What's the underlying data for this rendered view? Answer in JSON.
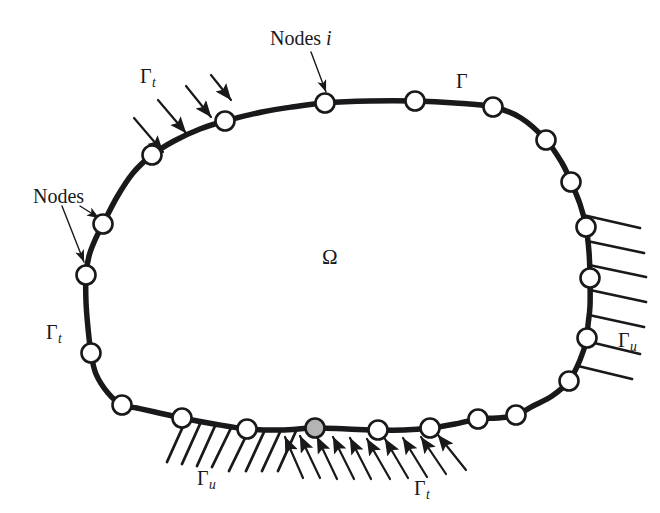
{
  "figure": {
    "kind": "boundary-node-discretization-diagram",
    "background_color": "#ffffff",
    "ink_color": "#19191c",
    "node_fill": "#ffffff",
    "node_highlight_fill": "#b4b4b4",
    "boundary_stroke_width": 5.5
  },
  "labels": {
    "nodes_i": {
      "text_plain": "Nodes i",
      "prefix": "Nodes ",
      "italic": "i"
    },
    "gamma": {
      "symbol": "Γ",
      "sub": ""
    },
    "gamma_t_top": {
      "symbol": "Γ",
      "sub": "t"
    },
    "nodes": {
      "text": "Nodes"
    },
    "omega": {
      "symbol": "Ω"
    },
    "gamma_t_left": {
      "symbol": "Γ",
      "sub": "t"
    },
    "gamma_u_right": {
      "symbol": "Γ",
      "sub": "u"
    },
    "gamma_u_bottom": {
      "symbol": "Γ",
      "sub": "u"
    },
    "gamma_t_bottom": {
      "symbol": "Γ",
      "sub": "t"
    }
  },
  "chart_data": {
    "type": "scatter",
    "title": "",
    "xlabel": "",
    "ylabel": "",
    "xlim": [
      0,
      660
    ],
    "ylim": [
      0,
      513
    ],
    "grid": false,
    "legend_position": "none",
    "domain_label": "Ω",
    "boundary_label": "Γ",
    "boundary_outline": [
      [
        225,
        121
      ],
      [
        262,
        112
      ],
      [
        292,
        107
      ],
      [
        325,
        103
      ],
      [
        370,
        101
      ],
      [
        415,
        101
      ],
      [
        455,
        103
      ],
      [
        493,
        107
      ],
      [
        521,
        118
      ],
      [
        546,
        140
      ],
      [
        562,
        163
      ],
      [
        571,
        182
      ],
      [
        580,
        204
      ],
      [
        586,
        227
      ],
      [
        589,
        252
      ],
      [
        590,
        278
      ],
      [
        590,
        306
      ],
      [
        588,
        325
      ],
      [
        587,
        338
      ],
      [
        580,
        360
      ],
      [
        569,
        381
      ],
      [
        552,
        396
      ],
      [
        533,
        406
      ],
      [
        516,
        415
      ],
      [
        497,
        418
      ],
      [
        478,
        419
      ],
      [
        455,
        424
      ],
      [
        430,
        428
      ],
      [
        404,
        430
      ],
      [
        378,
        430
      ],
      [
        347,
        429
      ],
      [
        315,
        428
      ],
      [
        281,
        430
      ],
      [
        247,
        429
      ],
      [
        214,
        424
      ],
      [
        182,
        418
      ],
      [
        155,
        412
      ],
      [
        137,
        408
      ],
      [
        122,
        405
      ],
      [
        108,
        393
      ],
      [
        96,
        374
      ],
      [
        91,
        353
      ],
      [
        88,
        328
      ],
      [
        86,
        302
      ],
      [
        86,
        275
      ],
      [
        89,
        256
      ],
      [
        95,
        240
      ],
      [
        103,
        224
      ],
      [
        117,
        197
      ],
      [
        133,
        173
      ],
      [
        152,
        155
      ],
      [
        174,
        141
      ],
      [
        200,
        129
      ],
      [
        225,
        121
      ]
    ],
    "nodes": [
      {
        "id": 1,
        "x": 325,
        "y": 103,
        "fill": "white",
        "r": 9.5,
        "on": "gamma"
      },
      {
        "id": 2,
        "x": 415,
        "y": 101,
        "fill": "white",
        "r": 9.5,
        "on": "gamma"
      },
      {
        "id": 3,
        "x": 493,
        "y": 107,
        "fill": "white",
        "r": 9.5,
        "on": "gamma"
      },
      {
        "id": 4,
        "x": 546,
        "y": 140,
        "fill": "white",
        "r": 9.5,
        "on": "gamma"
      },
      {
        "id": 5,
        "x": 571,
        "y": 182,
        "fill": "white",
        "r": 9.5,
        "on": "gamma"
      },
      {
        "id": 6,
        "x": 586,
        "y": 227,
        "fill": "white",
        "r": 9.5,
        "on": "gamma_u"
      },
      {
        "id": 7,
        "x": 590,
        "y": 278,
        "fill": "white",
        "r": 9.5,
        "on": "gamma_u"
      },
      {
        "id": 8,
        "x": 587,
        "y": 338,
        "fill": "white",
        "r": 9.5,
        "on": "gamma_u"
      },
      {
        "id": 9,
        "x": 569,
        "y": 381,
        "fill": "white",
        "r": 9.5,
        "on": "gamma"
      },
      {
        "id": 10,
        "x": 516,
        "y": 415,
        "fill": "white",
        "r": 9.5,
        "on": "gamma"
      },
      {
        "id": 11,
        "x": 478,
        "y": 419,
        "fill": "white",
        "r": 9.5,
        "on": "gamma"
      },
      {
        "id": 12,
        "x": 430,
        "y": 428,
        "fill": "white",
        "r": 9.5,
        "on": "gamma_t"
      },
      {
        "id": 13,
        "x": 378,
        "y": 430,
        "fill": "white",
        "r": 9.5,
        "on": "gamma_t"
      },
      {
        "id": 14,
        "x": 315,
        "y": 428,
        "fill": "gray",
        "r": 9.5,
        "on": "gamma_t"
      },
      {
        "id": 15,
        "x": 247,
        "y": 429,
        "fill": "white",
        "r": 9.5,
        "on": "gamma_u"
      },
      {
        "id": 16,
        "x": 182,
        "y": 418,
        "fill": "white",
        "r": 9.5,
        "on": "gamma_u"
      },
      {
        "id": 17,
        "x": 122,
        "y": 405,
        "fill": "white",
        "r": 9.5,
        "on": "gamma"
      },
      {
        "id": 18,
        "x": 91,
        "y": 353,
        "fill": "white",
        "r": 9.5,
        "on": "gamma_t"
      },
      {
        "id": 19,
        "x": 86,
        "y": 275,
        "fill": "white",
        "r": 9.5,
        "on": "gamma_t"
      },
      {
        "id": 20,
        "x": 103,
        "y": 224,
        "fill": "white",
        "r": 9.5,
        "on": "gamma_t"
      },
      {
        "id": 21,
        "x": 152,
        "y": 155,
        "fill": "white",
        "r": 9.5,
        "on": "gamma_t"
      },
      {
        "id": 22,
        "x": 225,
        "y": 121,
        "fill": "white",
        "r": 9.5,
        "on": "gamma_t"
      }
    ],
    "traction_arrows_top": [
      {
        "x1": 134,
        "y1": 118,
        "x2": 163,
        "y2": 152
      },
      {
        "x1": 158,
        "y1": 100,
        "x2": 186,
        "y2": 133
      },
      {
        "x1": 186,
        "y1": 86,
        "x2": 211,
        "y2": 117
      },
      {
        "x1": 211,
        "y1": 75,
        "x2": 231,
        "y2": 100
      }
    ],
    "traction_arrows_bottom": [
      {
        "x1": 303,
        "y1": 478,
        "x2": 285,
        "y2": 437
      },
      {
        "x1": 320,
        "y1": 478,
        "x2": 300,
        "y2": 436
      },
      {
        "x1": 337,
        "y1": 479,
        "x2": 317,
        "y2": 437
      },
      {
        "x1": 354,
        "y1": 479,
        "x2": 333,
        "y2": 437
      },
      {
        "x1": 371,
        "y1": 479,
        "x2": 350,
        "y2": 438
      },
      {
        "x1": 390,
        "y1": 479,
        "x2": 367,
        "y2": 439
      },
      {
        "x1": 408,
        "y1": 478,
        "x2": 385,
        "y2": 439
      },
      {
        "x1": 427,
        "y1": 477,
        "x2": 403,
        "y2": 438
      },
      {
        "x1": 446,
        "y1": 474,
        "x2": 421,
        "y2": 437
      },
      {
        "x1": 466,
        "y1": 470,
        "x2": 438,
        "y2": 435
      }
    ],
    "support_hatch_right": [
      {
        "x1": 583,
        "y1": 215,
        "x2": 640,
        "y2": 228
      },
      {
        "x1": 587,
        "y1": 241,
        "x2": 644,
        "y2": 253
      },
      {
        "x1": 589,
        "y1": 265,
        "x2": 646,
        "y2": 277
      },
      {
        "x1": 590,
        "y1": 290,
        "x2": 646,
        "y2": 302
      },
      {
        "x1": 589,
        "y1": 315,
        "x2": 644,
        "y2": 327
      },
      {
        "x1": 586,
        "y1": 341,
        "x2": 640,
        "y2": 354
      },
      {
        "x1": 578,
        "y1": 366,
        "x2": 632,
        "y2": 379
      }
    ],
    "support_hatch_bottom": [
      {
        "x1": 185,
        "y1": 422,
        "x2": 167,
        "y2": 462
      },
      {
        "x1": 200,
        "y1": 424,
        "x2": 182,
        "y2": 464
      },
      {
        "x1": 215,
        "y1": 426,
        "x2": 197,
        "y2": 466
      },
      {
        "x1": 231,
        "y1": 428,
        "x2": 212,
        "y2": 467
      },
      {
        "x1": 248,
        "y1": 432,
        "x2": 229,
        "y2": 471
      },
      {
        "x1": 264,
        "y1": 432,
        "x2": 246,
        "y2": 471
      },
      {
        "x1": 280,
        "y1": 432,
        "x2": 262,
        "y2": 471
      },
      {
        "x1": 296,
        "y1": 431,
        "x2": 278,
        "y2": 471
      }
    ],
    "annotations": [
      {
        "label": "Nodes i",
        "target_node": 1,
        "leader": {
          "x1": 311,
          "y1": 52,
          "x2": 326,
          "y2": 92
        }
      },
      {
        "label": "Nodes",
        "target_node": 20,
        "leader": {
          "x1": 80,
          "y1": 206,
          "x2": 99,
          "y2": 218
        }
      },
      {
        "label": "Nodes",
        "target_node": 19,
        "leader": {
          "x1": 62,
          "y1": 206,
          "x2": 84,
          "y2": 262
        }
      },
      {
        "label": "Γ",
        "target": "boundary"
      },
      {
        "label": "Ω",
        "target": "domain"
      },
      {
        "label": "Γt",
        "target": "traction_boundary_top"
      },
      {
        "label": "Γt",
        "target": "traction_boundary_left"
      },
      {
        "label": "Γt",
        "target": "traction_boundary_bottom"
      },
      {
        "label": "Γu",
        "target": "support_boundary_right"
      },
      {
        "label": "Γu",
        "target": "support_boundary_bottom"
      }
    ]
  }
}
